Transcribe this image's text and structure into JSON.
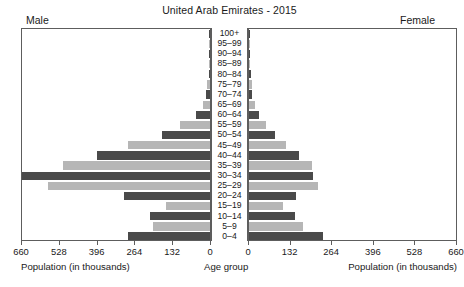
{
  "header": {
    "title": "United Arab Emirates - 2015",
    "left_label": "Male",
    "right_label": "Female"
  },
  "captions": {
    "left": "Population (in thousands)",
    "center": "Age group",
    "right": "Population (in thousands)"
  },
  "colors": {
    "bar_dark": "#4a4a4a",
    "bar_light": "#b6b6b6",
    "frame": "#5d5d5d",
    "background": "#ffffff"
  },
  "chart_data": {
    "type": "bar",
    "subtype": "population-pyramid",
    "title": "United Arab Emirates - 2015",
    "xlabel": "Population (in thousands)",
    "ylabel": "Age group",
    "xlim": [
      0,
      660
    ],
    "xticks": [
      0,
      132,
      264,
      396,
      528,
      660
    ],
    "xtick_labels": [
      "0",
      "132",
      "264",
      "396",
      "528",
      "660"
    ],
    "grid": false,
    "legend": "none",
    "categories": [
      "100+",
      "95-99",
      "90-94",
      "85-89",
      "80-84",
      "75-79",
      "70-74",
      "65-69",
      "60-64",
      "55-59",
      "50-54",
      "45-49",
      "40-44",
      "35-39",
      "30-34",
      "25-29",
      "20-24",
      "15-19",
      "10-14",
      "5-9",
      "0-4"
    ],
    "series": [
      {
        "name": "Male",
        "side": "left",
        "values": [
          0.3,
          0.8,
          1.6,
          3.0,
          5.0,
          9.0,
          15.0,
          24.0,
          50.0,
          106.0,
          166.0,
          286.0,
          396.0,
          512.0,
          672.0,
          566.0,
          302.0,
          152.0,
          210.0,
          198.0,
          286.0
        ]
      },
      {
        "name": "Female",
        "side": "right",
        "values": [
          0.4,
          1.0,
          2.0,
          3.5,
          5.5,
          8.0,
          11.0,
          18.0,
          31.0,
          55.0,
          84.0,
          118.0,
          160.0,
          200.0,
          204.0,
          220.0,
          150.0,
          108.0,
          146.0,
          172.0,
          234.0
        ]
      }
    ]
  }
}
